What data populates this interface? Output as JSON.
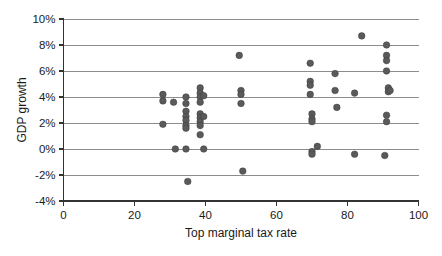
{
  "chart_data": {
    "type": "scatter",
    "title": "",
    "xlabel": "Top marginal tax rate",
    "ylabel": "GDP growth",
    "xlim": [
      0,
      100
    ],
    "ylim": [
      -4,
      10
    ],
    "grid": true,
    "legend": null,
    "x_ticks": [
      0,
      20,
      40,
      60,
      80,
      100
    ],
    "x_tick_labels": [
      "0",
      "20",
      "40",
      "60",
      "80",
      "100"
    ],
    "y_ticks": [
      -4,
      -2,
      0,
      2,
      4,
      6,
      8,
      10
    ],
    "y_tick_labels": [
      "-4%",
      "-2%",
      "0%",
      "2%",
      "4%",
      "6%",
      "8%",
      "10%"
    ],
    "marker_color": "#5a5a5a",
    "points": [
      {
        "x": 28,
        "y": 4.2
      },
      {
        "x": 28,
        "y": 3.7
      },
      {
        "x": 28,
        "y": 1.9
      },
      {
        "x": 31,
        "y": 3.6
      },
      {
        "x": 31.5,
        "y": 0.0
      },
      {
        "x": 34.5,
        "y": 4.0
      },
      {
        "x": 34.5,
        "y": 3.5
      },
      {
        "x": 34.5,
        "y": 2.9
      },
      {
        "x": 34.5,
        "y": 2.5
      },
      {
        "x": 34.5,
        "y": 2.2
      },
      {
        "x": 34.5,
        "y": 1.8
      },
      {
        "x": 34.5,
        "y": 1.6
      },
      {
        "x": 34.5,
        "y": 0.0
      },
      {
        "x": 35,
        "y": -2.5
      },
      {
        "x": 38.5,
        "y": 4.7
      },
      {
        "x": 38.5,
        "y": 4.3
      },
      {
        "x": 38.5,
        "y": 4.0
      },
      {
        "x": 38.5,
        "y": 3.6
      },
      {
        "x": 38.5,
        "y": 2.7
      },
      {
        "x": 38.5,
        "y": 2.4
      },
      {
        "x": 38.5,
        "y": 2.1
      },
      {
        "x": 38.5,
        "y": 1.8
      },
      {
        "x": 38.5,
        "y": 1.1
      },
      {
        "x": 39.5,
        "y": 4.1
      },
      {
        "x": 39.5,
        "y": 2.5
      },
      {
        "x": 39.5,
        "y": 0.0
      },
      {
        "x": 49.5,
        "y": 7.2
      },
      {
        "x": 50,
        "y": 4.5
      },
      {
        "x": 50,
        "y": 4.2
      },
      {
        "x": 50,
        "y": 3.5
      },
      {
        "x": 50.5,
        "y": -1.7
      },
      {
        "x": 69.5,
        "y": 6.6
      },
      {
        "x": 69.5,
        "y": 5.2
      },
      {
        "x": 69.5,
        "y": 4.9
      },
      {
        "x": 69.5,
        "y": 4.2
      },
      {
        "x": 70,
        "y": 2.7
      },
      {
        "x": 70,
        "y": 2.3
      },
      {
        "x": 70,
        "y": 2.1
      },
      {
        "x": 70,
        "y": -0.2
      },
      {
        "x": 70,
        "y": -0.4
      },
      {
        "x": 71.5,
        "y": 0.2
      },
      {
        "x": 76.5,
        "y": 4.5
      },
      {
        "x": 76.5,
        "y": 5.8
      },
      {
        "x": 77,
        "y": 3.2
      },
      {
        "x": 82,
        "y": 4.3
      },
      {
        "x": 82,
        "y": -0.4
      },
      {
        "x": 84,
        "y": 8.7
      },
      {
        "x": 90.5,
        "y": -0.5
      },
      {
        "x": 91,
        "y": 8.0
      },
      {
        "x": 91,
        "y": 7.2
      },
      {
        "x": 91,
        "y": 6.8
      },
      {
        "x": 91,
        "y": 6.0
      },
      {
        "x": 91.5,
        "y": 4.7
      },
      {
        "x": 91.5,
        "y": 4.4
      },
      {
        "x": 92,
        "y": 4.5
      },
      {
        "x": 91,
        "y": 2.6
      },
      {
        "x": 91,
        "y": 2.1
      }
    ]
  }
}
